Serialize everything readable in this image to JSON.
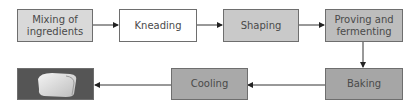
{
  "diagram": {
    "type": "process-flowchart",
    "steps": [
      {
        "id": "mixing",
        "label": "Mixing of ingredients",
        "line1": "Mixing of",
        "line2": "ingredients",
        "fill": "#d9d9d9"
      },
      {
        "id": "kneading",
        "label": "Kneading",
        "fill": "#ffffff"
      },
      {
        "id": "shaping",
        "label": "Shaping",
        "fill": "#c9c9c9"
      },
      {
        "id": "proving",
        "label": "Proving and fermenting",
        "line1": "Proving and",
        "line2": "fermenting",
        "fill": "#bdbdbd"
      },
      {
        "id": "baking",
        "label": "Baking",
        "fill": "#a6a6a6"
      },
      {
        "id": "cooling",
        "label": "Cooling",
        "fill": "#a9a9a9"
      },
      {
        "id": "bread",
        "label": "",
        "icon": "bread-loaf-icon",
        "fill": "#555555"
      }
    ],
    "edges": [
      [
        "mixing",
        "kneading"
      ],
      [
        "kneading",
        "shaping"
      ],
      [
        "shaping",
        "proving"
      ],
      [
        "proving",
        "baking"
      ],
      [
        "baking",
        "cooling"
      ],
      [
        "cooling",
        "bread"
      ]
    ]
  }
}
